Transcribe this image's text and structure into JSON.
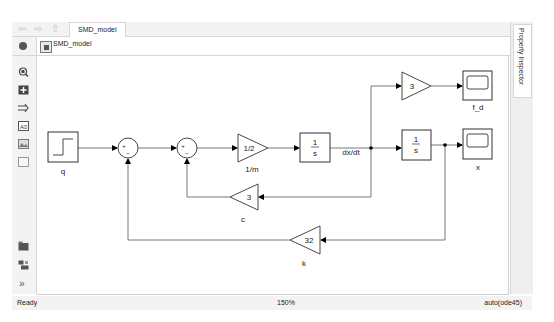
{
  "window": {
    "tab_label": "SMD_model",
    "nav": {
      "back_icon": "back-arrow-icon",
      "forward_icon": "forward-arrow-icon",
      "up_icon": "up-to-parent-icon"
    }
  },
  "address_bar": {
    "path": "SMD_model",
    "dropdown_icon": "chevron-down-icon"
  },
  "palette": {
    "top_items": [
      {
        "name": "zoom-to-fit-icon"
      },
      {
        "name": "fit-to-view-icon"
      },
      {
        "name": "arrow-shortcut-icon"
      },
      {
        "name": "annotation-icon"
      },
      {
        "name": "image-icon"
      },
      {
        "name": "area-icon"
      }
    ],
    "bottom_items": [
      {
        "name": "model-browser-icon"
      },
      {
        "name": "hierarchy-icon"
      },
      {
        "name": "expand-palette-icon",
        "glyph": "»"
      }
    ]
  },
  "inspector": {
    "label": "Property Inspector"
  },
  "diagram": {
    "blocks": {
      "step": {
        "label": "q"
      },
      "sum1": {
        "signs_in": "+",
        "signs_bottom": "−"
      },
      "sum2": {
        "signs_in": "+",
        "signs_bottom": "−"
      },
      "gain_m": {
        "value": "1/2",
        "label": "1/m"
      },
      "int1": {
        "num": "1",
        "den": "s"
      },
      "gain_fd": {
        "value": "3"
      },
      "scope_fd": {
        "label": "f_d"
      },
      "int2": {
        "num": "1",
        "den": "s"
      },
      "scope_x": {
        "label": "x"
      },
      "gain_c": {
        "value": "3",
        "label": "c"
      },
      "gain_k": {
        "value": "32",
        "label": "k"
      }
    },
    "signal_labels": {
      "velocity": "dx/dt"
    }
  },
  "status_bar": {
    "state": "Ready",
    "zoom": "150%",
    "solver": "auto(ode45)"
  }
}
